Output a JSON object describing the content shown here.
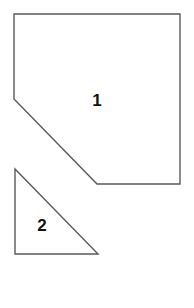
{
  "diagram": {
    "width": 194,
    "height": 308,
    "shapes": [
      {
        "id": "shape-1",
        "type": "pentagon",
        "label": "1",
        "points": [
          [
            14,
            14
          ],
          [
            180,
            14
          ],
          [
            180,
            184
          ],
          [
            97,
            184
          ],
          [
            14,
            99
          ]
        ],
        "label_position": [
          97,
          106
        ]
      },
      {
        "id": "shape-2",
        "type": "right-triangle",
        "label": "2",
        "points": [
          [
            15,
            169
          ],
          [
            15,
            254
          ],
          [
            98,
            254
          ]
        ],
        "label_position": [
          42,
          231
        ]
      }
    ],
    "stroke_color": "#5a5a5a",
    "fill_color": "#ffffff",
    "label_color": "#111111"
  }
}
